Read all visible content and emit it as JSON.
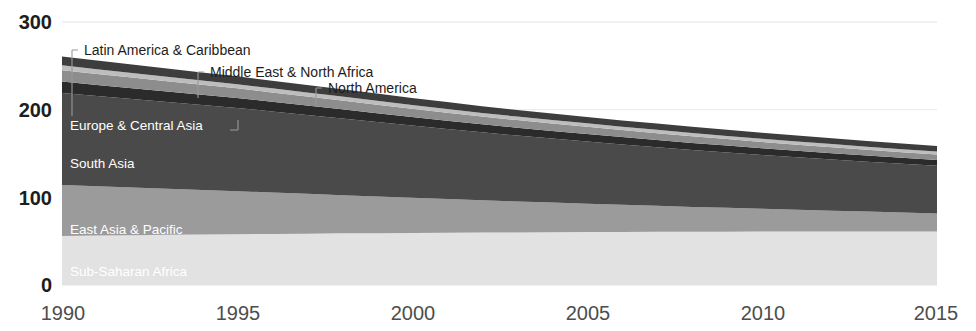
{
  "chart_data": {
    "type": "area",
    "stacked": true,
    "title": "",
    "subtitle": "",
    "xlabel": "",
    "ylabel": "",
    "x": [
      1990,
      1991,
      1992,
      1993,
      1994,
      1995,
      1996,
      1997,
      1998,
      1999,
      2000,
      2001,
      2002,
      2003,
      2004,
      2005,
      2006,
      2007,
      2008,
      2009,
      2010,
      2011,
      2012,
      2013,
      2014,
      2015
    ],
    "xlim": [
      1990,
      2015
    ],
    "ylim": [
      0,
      300
    ],
    "xticks": [
      1990,
      1995,
      2000,
      2005,
      2010,
      2015
    ],
    "xticklabels": [
      "1990",
      "1995",
      "2000",
      "2005",
      "2010",
      "2015"
    ],
    "yticks": [
      0,
      100,
      200,
      300
    ],
    "yticklabels": [
      "0",
      "100",
      "200",
      "300"
    ],
    "grid": "y-only-faint",
    "legend": "inline-labels",
    "series": [
      {
        "name": "Sub-Saharan Africa",
        "color": "#e2e2e2",
        "label_position": "inside",
        "values": [
          56,
          56.4,
          56.8,
          57.2,
          57.6,
          58,
          58.3,
          58.6,
          58.9,
          59.1,
          59.4,
          59.6,
          59.8,
          60,
          60.2,
          60.4,
          60.5,
          60.6,
          60.7,
          60.8,
          60.9,
          60.9,
          61,
          61,
          61,
          61
        ]
      },
      {
        "name": "East Asia & Pacific",
        "color": "#9b9b9b",
        "label_position": "inside",
        "values": [
          58,
          56.2,
          54.4,
          52.6,
          50.8,
          49,
          47.2,
          45.4,
          43.6,
          41.8,
          40,
          38.4,
          36.8,
          35.3,
          33.8,
          32.4,
          31,
          29.7,
          28.4,
          27.2,
          26,
          24.9,
          23.8,
          22.7,
          21.6,
          20.5
        ]
      },
      {
        "name": "South Asia",
        "color": "#4a4a4a",
        "label_position": "inside",
        "values": [
          105,
          103,
          101,
          99,
          97,
          95,
          92.5,
          90,
          87.5,
          85,
          82.5,
          80,
          77.5,
          75.2,
          73,
          70.9,
          68.8,
          66.9,
          65,
          63.2,
          61.5,
          59.9,
          58.4,
          57,
          55.7,
          54.5
        ]
      },
      {
        "name": "Europe & Central Asia",
        "color": "#2b2b2b",
        "label_position": "inside-with-leader",
        "values": [
          13,
          12.6,
          12.2,
          11.9,
          11.6,
          11.3,
          11,
          10.7,
          10.4,
          10.1,
          9.8,
          9.5,
          9.2,
          9,
          8.8,
          8.6,
          8.4,
          8.2,
          8,
          7.8,
          7.6,
          7.4,
          7.2,
          7,
          6.8,
          6.6
        ]
      },
      {
        "name": "Middle East & North Africa",
        "color": "#8d8d8d",
        "label_position": "leader",
        "values": [
          13,
          12.6,
          12.2,
          11.8,
          11.4,
          11,
          10.6,
          10.3,
          10,
          9.7,
          9.4,
          9.1,
          8.8,
          8.6,
          8.4,
          8.2,
          8,
          7.8,
          7.6,
          7.4,
          7.2,
          7,
          6.8,
          6.6,
          6.4,
          6.2
        ]
      },
      {
        "name": "Latin America & Caribbean",
        "color": "#bdbdbd",
        "label_position": "leader",
        "values": [
          5.6,
          5.4,
          5.2,
          5,
          4.9,
          4.8,
          4.7,
          4.6,
          4.5,
          4.4,
          4.3,
          4.2,
          4.1,
          4,
          3.95,
          3.9,
          3.85,
          3.8,
          3.75,
          3.7,
          3.65,
          3.6,
          3.55,
          3.5,
          3.45,
          3.4
        ]
      },
      {
        "name": "North America",
        "color": "#3d3d3d",
        "label_position": "leader",
        "values": [
          10,
          9.8,
          9.6,
          9.4,
          9.2,
          9,
          8.8,
          8.6,
          8.4,
          8.2,
          8,
          7.85,
          7.7,
          7.55,
          7.4,
          7.3,
          7.2,
          7.1,
          7,
          6.9,
          6.8,
          6.7,
          6.6,
          6.5,
          6.4,
          6.3
        ]
      }
    ]
  },
  "labels": {
    "latin_america": "Latin America & Caribbean",
    "middle_east": "Middle East & North Africa",
    "north_america": "North America",
    "europe_central_asia": "Europe & Central Asia",
    "south_asia": "South Asia",
    "east_asia_pacific": "East Asia & Pacific",
    "sub_saharan_africa": "Sub-Saharan Africa"
  },
  "axis": {
    "y": {
      "t300": "300",
      "t200": "200",
      "t100": "100",
      "t0": "0"
    },
    "x": {
      "t1990": "1990",
      "t1995": "1995",
      "t2000": "2000",
      "t2005": "2005",
      "t2010": "2010",
      "t2015": "2015"
    }
  },
  "colors": {
    "background": "#ffffff",
    "axis_text": "#1d1d1b",
    "xtick_text": "#4d4d4d",
    "gridline": "#ededed",
    "leader": "#9a9a9a",
    "inline_label": "#ffffff"
  }
}
